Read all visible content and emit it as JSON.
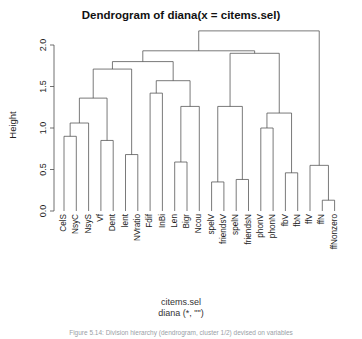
{
  "title": "Dendrogram of  diana(x = citems.sel)",
  "axis": {
    "ylabel": "Height",
    "ticks": [
      "0.0",
      "0.5",
      "1.0",
      "1.5",
      "2.0"
    ]
  },
  "caption": {
    "line1": "citems.sel",
    "line2": "diana (*, \"\")"
  },
  "footer": "Figure 5.14:  Division hierarchy (dendrogram, cluster 1/2) devised on variables",
  "chart_data": {
    "type": "dendrogram",
    "title": "Dendrogram of  diana(x = citems.sel)",
    "xlabel": "citems.sel",
    "ylabel": "Height",
    "ylim": [
      0.0,
      2.25
    ],
    "yticks": [
      0.0,
      0.5,
      1.0,
      1.5,
      2.0
    ],
    "grid": false,
    "method": "diana",
    "leaves": [
      "CelS",
      "NsyC",
      "NsyS",
      "Vf",
      "Dent",
      "lent",
      "NVratio",
      "Fdif",
      "InBi",
      "Len",
      "Bigr",
      "Ncou",
      "spelV",
      "friendsV",
      "spelN",
      "friendsN",
      "phonV",
      "phonN",
      "fbV",
      "fbN",
      "ffV",
      "ffN",
      "ffNonzero"
    ],
    "merges": [
      {
        "id": "m1",
        "left": "CelS",
        "right": "NsyC",
        "height": 0.9
      },
      {
        "id": "m2",
        "left": "m1",
        "right": "NsyS",
        "height": 1.06
      },
      {
        "id": "m3",
        "left": "Vf",
        "right": "Dent",
        "height": 0.85
      },
      {
        "id": "m4",
        "left": "m2",
        "right": "m3",
        "height": 1.36
      },
      {
        "id": "m5",
        "left": "lent",
        "right": "NVratio",
        "height": 0.68
      },
      {
        "id": "m6",
        "left": "m4",
        "right": "m5",
        "height": 1.71
      },
      {
        "id": "m7",
        "left": "Fdif",
        "right": "InBi",
        "height": 1.42
      },
      {
        "id": "m8",
        "left": "Len",
        "right": "Bigr",
        "height": 0.59
      },
      {
        "id": "m9",
        "left": "m8",
        "right": "Ncou",
        "height": 1.26
      },
      {
        "id": "m10",
        "left": "m7",
        "right": "m9",
        "height": 1.57
      },
      {
        "id": "m11",
        "left": "m6",
        "right": "m10",
        "height": 1.8
      },
      {
        "id": "m12",
        "left": "spelV",
        "right": "friendsV",
        "height": 0.35
      },
      {
        "id": "m13",
        "left": "spelN",
        "right": "friendsN",
        "height": 0.38
      },
      {
        "id": "m14",
        "left": "m12",
        "right": "m13",
        "height": 1.26
      },
      {
        "id": "m15",
        "left": "phonV",
        "right": "phonN",
        "height": 1.0
      },
      {
        "id": "m16",
        "left": "fbV",
        "right": "fbN",
        "height": 0.46
      },
      {
        "id": "m17",
        "left": "m15",
        "right": "m16",
        "height": 1.18
      },
      {
        "id": "m18",
        "left": "m14",
        "right": "m17",
        "height": 1.9
      },
      {
        "id": "m19",
        "left": "m11",
        "right": "m18",
        "height": 1.93
      },
      {
        "id": "m20",
        "left": "ffN",
        "right": "ffNonzero",
        "height": 0.13
      },
      {
        "id": "m21",
        "left": "ffV",
        "right": "m20",
        "height": 0.55
      },
      {
        "id": "m22",
        "left": "m19",
        "right": "m21",
        "height": 2.17
      }
    ]
  }
}
